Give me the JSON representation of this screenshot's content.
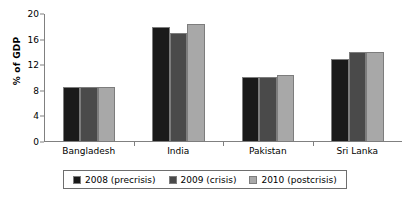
{
  "chart_data": {
    "type": "bar",
    "title": "",
    "xlabel": "",
    "ylabel": "% of GDP",
    "ylim": [
      0,
      20
    ],
    "yticks": [
      0,
      4,
      8,
      12,
      16,
      20
    ],
    "ytick_labels": [
      "0",
      "4",
      "8",
      "12",
      "16",
      "20"
    ],
    "grid": false,
    "legend_position": "bottom",
    "categories": [
      "Bangladesh",
      "India",
      "Pakistan",
      "Sri Lanka"
    ],
    "series": [
      {
        "name": "2008 (precrisis)",
        "color": "#1a1a1a",
        "values": [
          8.6,
          18.0,
          10.1,
          13.0
        ]
      },
      {
        "name": "2009 (crisis)",
        "color": "#4a4a4a",
        "values": [
          8.6,
          17.0,
          10.1,
          14.1
        ]
      },
      {
        "name": "2010 (postcrisis)",
        "color": "#a8a8a8",
        "values": [
          8.6,
          18.5,
          10.5,
          14.1
        ]
      }
    ]
  },
  "axis": {
    "line_color": "#808080"
  }
}
